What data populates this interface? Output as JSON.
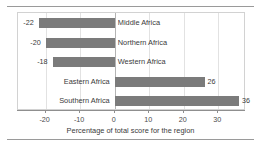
{
  "chart_data": {
    "type": "bar",
    "orientation": "horizontal",
    "title": "",
    "xlabel": "Percentage of total score for the region",
    "ylabel": "",
    "categories": [
      "Middle Africa",
      "Northern Africa",
      "Western Africa",
      "Eastern Africa",
      "Southern Africa"
    ],
    "values": [
      -22,
      -20,
      -18,
      26,
      36
    ],
    "data_labels": [
      "-22",
      "-20",
      "-18",
      "26",
      "36"
    ],
    "xlim": [
      -28,
      38
    ],
    "xticks": [
      -20,
      -10,
      0,
      10,
      20,
      30
    ],
    "xtick_labels": [
      "-20",
      "-10",
      "0",
      "10",
      "20",
      "30"
    ],
    "grid": true,
    "legend": false,
    "bar_color": "#7b7b7b",
    "zero_line_color": "#b4b4b4",
    "grid_color": "#e2e2e2",
    "axis_color": "#8f8f8f",
    "background": "#ffffff"
  }
}
